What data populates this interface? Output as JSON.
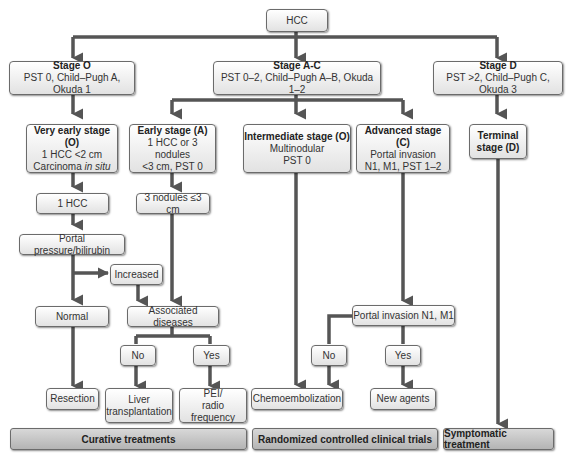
{
  "root": {
    "label": "HCC"
  },
  "stages": [
    {
      "title": "Stage O",
      "criteria": "PST 0, Child–Pugh A, Okuda 1"
    },
    {
      "title": "Stage A-C",
      "criteria": "PST 0–2, Child–Pugh A–B, Okuda 1–2"
    },
    {
      "title": "Stage D",
      "criteria": "PST >2, Child–Pugh C, Okuda 3"
    }
  ],
  "substages": {
    "very_early": {
      "title": "Very early stage (O)",
      "line1": "1 HCC <2 cm",
      "line2a": "Carcinoma ",
      "line2b": "in situ"
    },
    "early": {
      "title": "Early stage (A)",
      "line1": "1 HCC or 3 nodules",
      "line2": "<3 cm, PST 0"
    },
    "intermediate": {
      "title": "Intermediate stage (O)",
      "line1": "Multinodular",
      "line2": "PST 0"
    },
    "advanced": {
      "title": "Advanced stage (C)",
      "line1": "Portal invasion",
      "line2": "N1, M1, PST 1–2"
    },
    "terminal": {
      "title1": "Terminal",
      "title2": "stage (D)"
    }
  },
  "nodes": {
    "one_hcc": "1 HCC",
    "three_nodules": "3 nodules ≤3 cm",
    "portal_pressure": "Portal pressure/bilirubin",
    "increased": "Increased",
    "normal": "Normal",
    "associated_diseases": "Associated diseases",
    "no_left": "No",
    "yes_left": "Yes",
    "portal_invasion": "Portal invasion N1, M1",
    "no_right": "No",
    "yes_right": "Yes"
  },
  "treatments": {
    "resection": "Resection",
    "liver_tx_1": "Liver",
    "liver_tx_2": "transplantation",
    "pei_1": "PEI/",
    "pei_2": "radio frequency",
    "chemo": "Chemoembolization",
    "new_agents": "New agents"
  },
  "categories": {
    "curative": "Curative treatments",
    "rct": "Randomized controlled clinical trials",
    "symptomatic": "Symptomatic treatment"
  },
  "colors": {
    "arrow": "#555555",
    "box_border": "#6b6b6b",
    "band_fill": "#c4c4c4"
  }
}
